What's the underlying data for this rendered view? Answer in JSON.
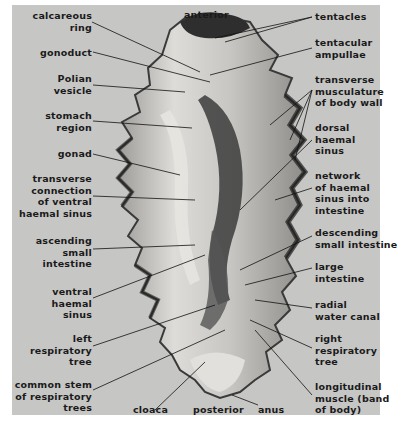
{
  "figure": {
    "background_color": "#c6c6c4",
    "specimen_colors": {
      "light": "#dcdad6",
      "mid": "#a8a6a2",
      "dark": "#2a2a2a"
    }
  },
  "labels": {
    "top": {
      "anterior": "anterior"
    },
    "left": [
      {
        "id": "calcareous-ring",
        "text": "calcareous\nring"
      },
      {
        "id": "gonoduct",
        "text": "gonoduct"
      },
      {
        "id": "polian-vesicle",
        "text": "Polian\nvesicle"
      },
      {
        "id": "stomach-region",
        "text": "stomach\nregion"
      },
      {
        "id": "gonad",
        "text": "gonad"
      },
      {
        "id": "transverse-connection",
        "text": "transverse\nconnection\nof ventral\nhaemal sinus"
      },
      {
        "id": "ascending-small-intestine",
        "text": "ascending\nsmall\nintestine"
      },
      {
        "id": "ventral-haemal-sinus",
        "text": "ventral\nhaemal\nsinus"
      },
      {
        "id": "left-respiratory-tree",
        "text": "left\nrespiratory\ntree"
      },
      {
        "id": "common-stem",
        "text": "common stem\nof respiratory\ntrees"
      }
    ],
    "right": [
      {
        "id": "tentacles",
        "text": "tentacles"
      },
      {
        "id": "tentacular-ampullae",
        "text": "tentacular\nampullae"
      },
      {
        "id": "transverse-musculature",
        "text": "transverse\nmusculature\nof body wall"
      },
      {
        "id": "dorsal-haemal-sinus",
        "text": "dorsal\nhaemal\nsinus"
      },
      {
        "id": "network-haemal-sinus",
        "text": "network\nof haemal\nsinus into\nintestine"
      },
      {
        "id": "descending-small-intestine",
        "text": "descending\nsmall intestine"
      },
      {
        "id": "large-intestine",
        "text": "large\nintestine"
      },
      {
        "id": "radial-water-canal",
        "text": "radial\nwater canal"
      },
      {
        "id": "right-respiratory-tree",
        "text": "right\nrespiratory\ntree"
      },
      {
        "id": "longitudinal-muscle",
        "text": "longitudinal\nmuscle (band\nof body)"
      }
    ],
    "bottom": [
      {
        "id": "cloaca",
        "text": "cloaca"
      },
      {
        "id": "posterior",
        "text": "posterior"
      },
      {
        "id": "anus",
        "text": "anus"
      }
    ]
  }
}
